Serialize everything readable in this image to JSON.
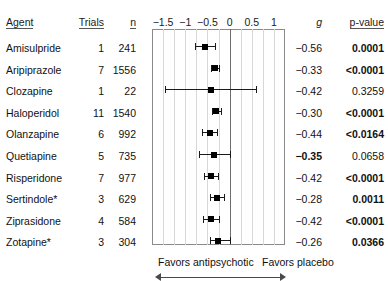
{
  "table": {
    "headers": {
      "agent": "Agent",
      "trials": "Trials",
      "n": "n",
      "g": "g",
      "pvalue": "p-value"
    }
  },
  "footer": {
    "favors_left": "Favors antipsychotic",
    "favors_right": "Favors placebo",
    "left_arrow_icon": "arrow-left-icon",
    "right_arrow_icon": "arrow-right-icon"
  },
  "chart_data": {
    "type": "forest",
    "title": "",
    "xlabel": "",
    "ylabel": "",
    "xlim": [
      -1.75,
      1.25
    ],
    "ticks": [
      -1.5,
      -1,
      -0.5,
      0,
      0.5,
      1
    ],
    "tick_labels": [
      "−1.5",
      "−1",
      "−0.5",
      "0",
      "0.5",
      "1"
    ],
    "gridlines": [
      -1.5,
      -1.25,
      -1,
      -0.75,
      -0.5,
      -0.25,
      0.25,
      0.5,
      0.75,
      1
    ],
    "zero_line": 0,
    "grid": true,
    "legend_position": "none",
    "categories": [
      "Amisulpride",
      "Aripiprazole",
      "Clozapine",
      "Haloperidol",
      "Olanzapine",
      "Quetiapine",
      "Risperidone",
      "Sertindole*",
      "Ziprasidone",
      "Zotapine*"
    ],
    "rows": [
      {
        "agent": "Amisulpride",
        "trials": "1",
        "n": "241",
        "g": "−0.56",
        "g_value": -0.56,
        "ci_low": -0.78,
        "ci_high": -0.34,
        "pvalue": "0.0001",
        "p_bold": true,
        "g_bold": false
      },
      {
        "agent": "Aripiprazole",
        "trials": "7",
        "n": "1556",
        "g": "−0.33",
        "g_value": -0.33,
        "ci_low": -0.43,
        "ci_high": -0.23,
        "pvalue": "<0.0001",
        "p_bold": true,
        "g_bold": false
      },
      {
        "agent": "Clozapine",
        "trials": "1",
        "n": "22",
        "g": "−0.42",
        "g_value": -0.42,
        "ci_low": -1.46,
        "ci_high": 0.6,
        "pvalue": "0.3259",
        "p_bold": false,
        "g_bold": false
      },
      {
        "agent": "Haloperidol",
        "trials": "11",
        "n": "1540",
        "g": "−0.30",
        "g_value": -0.3,
        "ci_low": -0.4,
        "ci_high": -0.2,
        "pvalue": "<0.0001",
        "p_bold": true,
        "g_bold": false
      },
      {
        "agent": "Olanzapine",
        "trials": "6",
        "n": "992",
        "g": "−0.44",
        "g_value": -0.44,
        "ci_low": -0.62,
        "ci_high": -0.28,
        "pvalue": "<0.0164",
        "p_bold": true,
        "g_bold": false
      },
      {
        "agent": "Quetiapine",
        "trials": "5",
        "n": "735",
        "g": "−0.35",
        "g_value": -0.35,
        "ci_low": -0.7,
        "ci_high": 0.0,
        "pvalue": "0.0658",
        "p_bold": false,
        "g_bold": true
      },
      {
        "agent": "Risperidone",
        "trials": "7",
        "n": "977",
        "g": "−0.42",
        "g_value": -0.42,
        "ci_low": -0.58,
        "ci_high": -0.26,
        "pvalue": "<0.0001",
        "p_bold": true,
        "g_bold": false
      },
      {
        "agent": "Sertindole*",
        "trials": "3",
        "n": "629",
        "g": "−0.28",
        "g_value": -0.28,
        "ci_low": -0.44,
        "ci_high": -0.12,
        "pvalue": "0.0011",
        "p_bold": true,
        "g_bold": false
      },
      {
        "agent": "Ziprasidone",
        "trials": "4",
        "n": "584",
        "g": "−0.42",
        "g_value": -0.42,
        "ci_low": -0.6,
        "ci_high": -0.24,
        "pvalue": "<0.0001",
        "p_bold": true,
        "g_bold": false
      },
      {
        "agent": "Zotapine*",
        "trials": "3",
        "n": "304",
        "g": "−0.26",
        "g_value": -0.26,
        "ci_low": -0.44,
        "ci_high": 0.0,
        "pvalue": "0.0366",
        "p_bold": true,
        "g_bold": false
      }
    ]
  }
}
